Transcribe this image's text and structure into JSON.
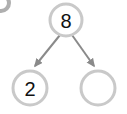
{
  "diagram": {
    "type": "number-bond",
    "background_color": "#ffffff",
    "node_stroke_color": "#c9c9c9",
    "node_fill_color": "#ffffff",
    "node_stroke_width": 3,
    "label_color": "#111111",
    "arrow_color": "#8a8a8a",
    "arrow_width": 2,
    "corner_mark_color": "#6e6e6e",
    "nodes": [
      {
        "id": "root",
        "role": "whole",
        "label": "8",
        "empty": false,
        "cx": 66,
        "cy": 20,
        "r": 16,
        "font_size": 20
      },
      {
        "id": "part-left",
        "role": "part",
        "label": "2",
        "empty": false,
        "cx": 30,
        "cy": 88,
        "r": 17,
        "font_size": 20
      },
      {
        "id": "part-right",
        "role": "part",
        "label": "",
        "empty": true,
        "cx": 98,
        "cy": 88,
        "r": 17,
        "font_size": 20
      }
    ],
    "arrows": [
      {
        "id": "arrow-left",
        "from": "root",
        "to": "part-left",
        "x1": 60,
        "y1": 35,
        "x2": 35,
        "y2": 66,
        "direction": "down-left"
      },
      {
        "id": "arrow-right",
        "from": "root",
        "to": "part-right",
        "x1": 72,
        "y1": 35,
        "x2": 94,
        "y2": 66,
        "direction": "down-right"
      }
    ],
    "corner_mark": {
      "id": "corner-partial-circle",
      "cx": 1,
      "cy": 3,
      "r": 8,
      "visible": true
    }
  }
}
